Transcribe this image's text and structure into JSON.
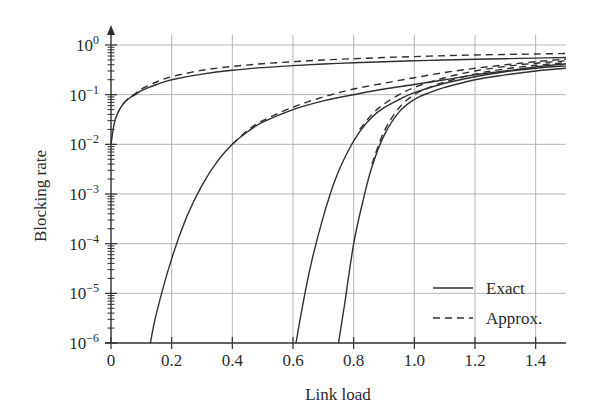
{
  "chart_data": {
    "type": "line",
    "title": "",
    "xlabel": "Link load",
    "ylabel": "Blocking rate",
    "xscale": "linear",
    "yscale": "log",
    "xlim": [
      0,
      1.5
    ],
    "ylim": [
      1e-06,
      1
    ],
    "grid": true,
    "legend_position": "lower right",
    "x_ticks": [
      0,
      0.2,
      0.4,
      0.6,
      0.8,
      1.0,
      1.2,
      1.4
    ],
    "x_tick_labels": [
      "0",
      "0.2",
      "0.4",
      "0.6",
      "0.8",
      "1.0",
      "1.2",
      "1.4"
    ],
    "y_ticks": [
      1e-06,
      1e-05,
      0.0001,
      0.001,
      0.01,
      0.1,
      1
    ],
    "y_tick_labels": [
      {
        "base": "10",
        "exp": "−6"
      },
      {
        "base": "10",
        "exp": "−5"
      },
      {
        "base": "10",
        "exp": "−4"
      },
      {
        "base": "10",
        "exp": "−3"
      },
      {
        "base": "10",
        "exp": "−2"
      },
      {
        "base": "10",
        "exp": "−1"
      },
      {
        "base": "10",
        "exp": "0"
      }
    ],
    "legend": [
      {
        "label": "Exact",
        "style": "solid"
      },
      {
        "label": "Approx.",
        "style": "dashed"
      }
    ],
    "series": [
      {
        "name": "Exact",
        "group": 1,
        "style": "solid",
        "x": [
          0.0,
          0.01,
          0.02,
          0.04,
          0.06,
          0.08,
          0.1,
          0.15,
          0.2,
          0.3,
          0.4,
          0.5,
          0.6,
          0.7,
          0.8,
          0.9,
          1.0,
          1.1,
          1.2,
          1.3,
          1.4,
          1.5
        ],
        "y": [
          0.01,
          0.025,
          0.04,
          0.065,
          0.085,
          0.1,
          0.12,
          0.16,
          0.2,
          0.26,
          0.31,
          0.35,
          0.385,
          0.415,
          0.44,
          0.46,
          0.48,
          0.5,
          0.515,
          0.53,
          0.545,
          0.56
        ]
      },
      {
        "name": "Approx.",
        "group": 1,
        "style": "dashed",
        "x": [
          0.04,
          0.06,
          0.08,
          0.1,
          0.15,
          0.2,
          0.3,
          0.4,
          0.5,
          0.6,
          0.7,
          0.8,
          0.9,
          1.0,
          1.1,
          1.2,
          1.3,
          1.4,
          1.5
        ],
        "y": [
          0.065,
          0.087,
          0.105,
          0.13,
          0.18,
          0.23,
          0.31,
          0.37,
          0.42,
          0.46,
          0.5,
          0.53,
          0.56,
          0.585,
          0.61,
          0.63,
          0.645,
          0.66,
          0.675
        ]
      },
      {
        "name": "Exact",
        "group": 2,
        "style": "solid",
        "x": [
          0.13,
          0.15,
          0.2,
          0.25,
          0.3,
          0.35,
          0.4,
          0.45,
          0.5,
          0.6,
          0.7,
          0.8,
          0.9,
          1.0,
          1.1,
          1.2,
          1.3,
          1.4,
          1.5
        ],
        "y": [
          1e-06,
          4e-06,
          5e-05,
          0.00035,
          0.0015,
          0.0045,
          0.01,
          0.018,
          0.028,
          0.05,
          0.075,
          0.1,
          0.13,
          0.16,
          0.2,
          0.25,
          0.3,
          0.36,
          0.42
        ]
      },
      {
        "name": "Approx.",
        "group": 2,
        "style": "dashed",
        "x": [
          0.4,
          0.45,
          0.5,
          0.6,
          0.7,
          0.8,
          0.9,
          1.0,
          1.1,
          1.2,
          1.3,
          1.4,
          1.5
        ],
        "y": [
          0.01,
          0.019,
          0.03,
          0.056,
          0.09,
          0.13,
          0.17,
          0.22,
          0.28,
          0.34,
          0.4,
          0.46,
          0.52
        ]
      },
      {
        "name": "Exact",
        "group": 3,
        "style": "solid",
        "x": [
          0.61,
          0.63,
          0.66,
          0.7,
          0.74,
          0.78,
          0.82,
          0.86,
          0.9,
          0.95,
          1.0,
          1.1,
          1.2,
          1.3,
          1.4,
          1.5
        ],
        "y": [
          1e-06,
          5e-06,
          4e-05,
          0.00035,
          0.002,
          0.007,
          0.018,
          0.035,
          0.055,
          0.08,
          0.11,
          0.17,
          0.23,
          0.29,
          0.34,
          0.38
        ]
      },
      {
        "name": "Approx.",
        "group": 3,
        "style": "dashed",
        "x": [
          0.82,
          0.86,
          0.9,
          0.95,
          1.0,
          1.1,
          1.2,
          1.3,
          1.4,
          1.5
        ],
        "y": [
          0.02,
          0.04,
          0.065,
          0.1,
          0.14,
          0.22,
          0.3,
          0.37,
          0.43,
          0.48
        ]
      },
      {
        "name": "Exact",
        "group": 4,
        "style": "solid",
        "x": [
          0.75,
          0.77,
          0.8,
          0.83,
          0.86,
          0.9,
          0.95,
          1.0,
          1.05,
          1.1,
          1.2,
          1.3,
          1.4,
          1.5
        ],
        "y": [
          1e-06,
          6e-06,
          0.0001,
          0.0007,
          0.0035,
          0.015,
          0.045,
          0.08,
          0.11,
          0.14,
          0.2,
          0.25,
          0.3,
          0.34
        ]
      },
      {
        "name": "Approx.",
        "group": 4,
        "style": "dashed",
        "x": [
          0.86,
          0.9,
          0.95,
          1.0,
          1.05,
          1.1,
          1.2,
          1.3,
          1.4,
          1.5
        ],
        "y": [
          0.004,
          0.018,
          0.055,
          0.1,
          0.14,
          0.18,
          0.26,
          0.33,
          0.39,
          0.44
        ]
      }
    ]
  },
  "layout": {
    "plot_left": 111,
    "plot_right": 566,
    "plot_top": 45,
    "plot_bottom": 343,
    "line_color": "#2f2f2f",
    "grid_color": "#b4b4b4"
  }
}
